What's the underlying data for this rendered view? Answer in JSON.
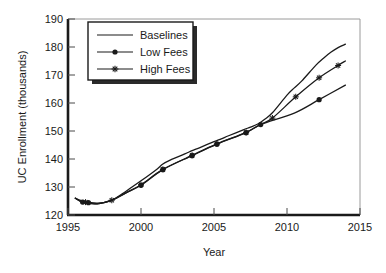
{
  "chart_data": {
    "type": "line",
    "title": "",
    "xlabel": "Year",
    "ylabel": "UC Enrollment (thousands)",
    "xlim": [
      1995,
      2015
    ],
    "ylim": [
      120,
      190
    ],
    "xticks": [
      "1995",
      "2000",
      "2005",
      "2010",
      "2015"
    ],
    "yticks": [
      "120",
      "130",
      "140",
      "150",
      "160",
      "170",
      "180",
      "190"
    ],
    "grid": false,
    "legend_position": "upper-left-inside",
    "series": [
      {
        "name": "Baselines",
        "marker": "none",
        "color": "#1a1a1a",
        "x": [
          1995.5,
          1996.0,
          1997.0,
          1998.0,
          1999.0,
          2000.0,
          2001.0,
          2001.5,
          2002.0,
          2003.0,
          2003.5,
          2004.0,
          2005.0,
          2005.5,
          2006.0,
          2007.0,
          2007.5,
          2008.0,
          2008.5,
          2009.0,
          2010.0,
          2010.5,
          2011.0,
          2012.0,
          2012.5,
          2013.0,
          2013.5,
          2014.0
        ],
        "y": [
          126.0,
          125.0,
          124.2,
          125.3,
          128.6,
          132.2,
          136.0,
          138.2,
          139.6,
          141.8,
          143.0,
          144.0,
          146.2,
          147.2,
          148.3,
          150.4,
          151.4,
          152.5,
          154.3,
          156.5,
          162.8,
          165.4,
          167.8,
          173.6,
          176.0,
          178.1,
          179.8,
          181.0
        ]
      },
      {
        "name": "Low Fees",
        "marker": "filled-circle",
        "color": "#1a1a1a",
        "x": [
          1995.5,
          1996.0,
          1997.0,
          1998.0,
          1999.0,
          2000.0,
          2001.5,
          2003.5,
          2005.2,
          2007.2,
          2008.2,
          2010.5,
          2012.2,
          2014.0
        ],
        "y": [
          126.0,
          124.6,
          124.0,
          125.3,
          128.0,
          130.6,
          136.2,
          141.2,
          145.3,
          149.4,
          152.3,
          156.4,
          161.2,
          166.4
        ],
        "markers_x": [
          1996.0,
          1996.4,
          2000.0,
          2001.5,
          2003.5,
          2005.2,
          2007.2,
          2008.2,
          2012.2
        ],
        "markers_y": [
          124.6,
          124.4,
          130.6,
          136.2,
          141.2,
          145.3,
          149.4,
          152.3,
          161.2
        ]
      },
      {
        "name": "High Fees",
        "marker": "star",
        "color": "#1a1a1a",
        "x": [
          1995.5,
          1996.0,
          1997.0,
          1998.0,
          1999.0,
          2000.0,
          2001.5,
          2003.5,
          2005.2,
          2007.2,
          2008.2,
          2009.0,
          2010.6,
          2012.2,
          2013.5,
          2014.0
        ],
        "y": [
          126.0,
          124.6,
          124.0,
          125.3,
          128.0,
          130.8,
          136.3,
          141.3,
          145.4,
          149.5,
          152.4,
          154.6,
          162.2,
          169.0,
          173.4,
          175.0
        ],
        "markers_x": [
          1996.2,
          1998.0,
          2000.0,
          2001.5,
          2003.5,
          2005.2,
          2007.2,
          2009.0,
          2010.6,
          2012.2,
          2013.5
        ],
        "markers_y": [
          124.6,
          125.3,
          130.8,
          136.3,
          141.3,
          145.4,
          149.5,
          154.6,
          162.2,
          169.0,
          173.4
        ]
      }
    ]
  },
  "legend": {
    "items": [
      {
        "label": "Baselines"
      },
      {
        "label": "Low Fees"
      },
      {
        "label": "High Fees"
      }
    ]
  },
  "axes": {
    "y_title": "UC Enrollment (thousands)",
    "x_title": "Year",
    "y_tick_0": "120",
    "y_tick_1": "130",
    "y_tick_2": "140",
    "y_tick_3": "150",
    "y_tick_4": "160",
    "y_tick_5": "170",
    "y_tick_6": "180",
    "y_tick_7": "190",
    "x_tick_0": "1995",
    "x_tick_1": "2000",
    "x_tick_2": "2005",
    "x_tick_3": "2010",
    "x_tick_4": "2015"
  }
}
